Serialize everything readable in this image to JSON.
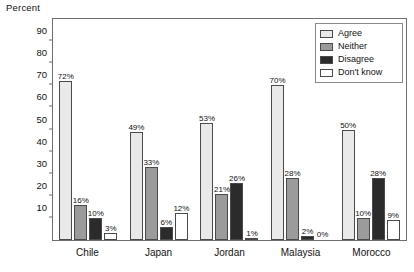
{
  "chart_data": {
    "type": "bar",
    "title": "",
    "subtitle": "",
    "xlabel": "",
    "ylabel": "Percent",
    "ylim": [
      0,
      100
    ],
    "yticks": [
      10,
      20,
      30,
      40,
      50,
      60,
      70,
      80,
      90
    ],
    "grid": false,
    "legend_position": "top-right",
    "categories": [
      "Chile",
      "Japan",
      "Jordan",
      "Malaysia",
      "Morocco"
    ],
    "series": [
      {
        "name": "Agree",
        "color": "#e9e9e9",
        "values": [
          72,
          49,
          53,
          70,
          50
        ],
        "labels": [
          "72%",
          "49%",
          "53%",
          "70%",
          "50%"
        ]
      },
      {
        "name": "Neither",
        "color": "#9b9b9b",
        "values": [
          16,
          33,
          21,
          28,
          10
        ],
        "labels": [
          "16%",
          "33%",
          "21%",
          "28%",
          "10%"
        ]
      },
      {
        "name": "Disagree",
        "color": "#2b2b2b",
        "values": [
          10,
          6,
          26,
          2,
          28
        ],
        "labels": [
          "10%",
          "6%",
          "26%",
          "2%",
          "28%"
        ]
      },
      {
        "name": "Don't know",
        "color": "#ffffff",
        "values": [
          3,
          12,
          1,
          0,
          9
        ],
        "labels": [
          "3%",
          "12%",
          "1%",
          "0%",
          "9%"
        ]
      }
    ]
  },
  "axis": {
    "y_title": "Percent",
    "ticks": [
      "90",
      "80",
      "70",
      "60",
      "50",
      "40",
      "30",
      "20",
      "10"
    ]
  },
  "legend": {
    "items": [
      {
        "label": "Agree"
      },
      {
        "label": "Neither"
      },
      {
        "label": "Disagree"
      },
      {
        "label": "Don't know"
      }
    ]
  }
}
